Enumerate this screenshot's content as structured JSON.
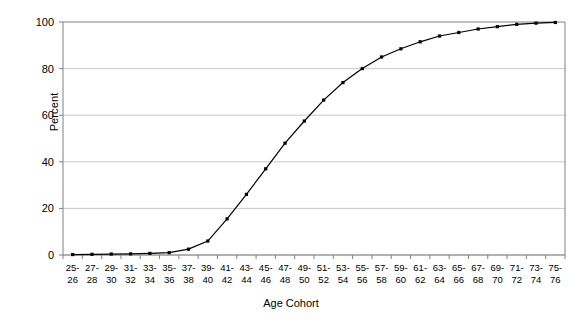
{
  "chart_data": {
    "type": "line",
    "title": "",
    "xlabel": "Age Cohort",
    "ylabel": "Percent",
    "ylim": [
      0,
      100
    ],
    "yticks": [
      0,
      20,
      40,
      60,
      80,
      100
    ],
    "grid": true,
    "legend": false,
    "marker": "square",
    "line_color": "#000000",
    "marker_color": "#000000",
    "grid_color": "#c8c8c8",
    "axis_color": "#808080",
    "categories": [
      "25-26",
      "27-28",
      "29-30",
      "31-32",
      "33-34",
      "35-36",
      "37-38",
      "39-40",
      "41-42",
      "43-44",
      "45-46",
      "47-48",
      "49-50",
      "51-52",
      "53-54",
      "55-56",
      "57-58",
      "59-60",
      "61-62",
      "63-64",
      "65-66",
      "67-68",
      "69-70",
      "71-72",
      "73-74",
      "75-76"
    ],
    "category_lines": [
      [
        "25-",
        "26"
      ],
      [
        "27-",
        "28"
      ],
      [
        "29-",
        "30"
      ],
      [
        "31-",
        "32"
      ],
      [
        "33-",
        "34"
      ],
      [
        "35-",
        "36"
      ],
      [
        "37-",
        "38"
      ],
      [
        "39-",
        "40"
      ],
      [
        "41-",
        "42"
      ],
      [
        "43-",
        "44"
      ],
      [
        "45-",
        "46"
      ],
      [
        "47-",
        "48"
      ],
      [
        "49-",
        "50"
      ],
      [
        "51-",
        "52"
      ],
      [
        "53-",
        "54"
      ],
      [
        "55-",
        "56"
      ],
      [
        "57-",
        "58"
      ],
      [
        "59-",
        "60"
      ],
      [
        "61-",
        "62"
      ],
      [
        "63-",
        "64"
      ],
      [
        "65-",
        "66"
      ],
      [
        "67-",
        "68"
      ],
      [
        "69-",
        "70"
      ],
      [
        "71-",
        "72"
      ],
      [
        "73-",
        "74"
      ],
      [
        "75-",
        "76"
      ]
    ],
    "values": [
      0.2,
      0.3,
      0.4,
      0.5,
      0.7,
      1.0,
      2.5,
      6.0,
      15.5,
      26.0,
      37.0,
      48.0,
      57.5,
      66.5,
      74.0,
      80.0,
      85.0,
      88.5,
      91.5,
      94.0,
      95.5,
      97.0,
      98.0,
      99.0,
      99.5,
      99.8
    ]
  }
}
